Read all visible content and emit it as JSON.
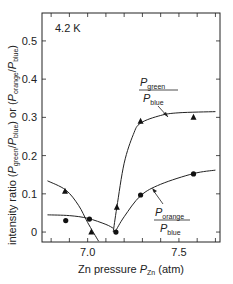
{
  "chart_data": {
    "type": "scatter",
    "title": "",
    "annotation": "4.2 K",
    "xlabel": "Zn pressure P_Zn (atm)",
    "ylabel": "intensity ratio (P_green/P_blue) or (P_orange/P_blue)",
    "xlim": [
      6.75,
      7.725
    ],
    "ylim": [
      -0.026,
      0.573
    ],
    "x_ticks": [
      6.8,
      6.9,
      7.0,
      7.1,
      7.2,
      7.3,
      7.4,
      7.5,
      7.6,
      7.7
    ],
    "x_tick_labels": [
      {
        "value": 7.0,
        "label": "7.0"
      },
      {
        "value": 7.5,
        "label": "7.5"
      }
    ],
    "y_ticks": [
      0,
      0.1,
      0.2,
      0.3,
      0.4,
      0.5
    ],
    "y_tick_labels": [
      "0",
      "0.1",
      "0.2",
      "0.3",
      "0.4",
      "0.5"
    ],
    "grid": false,
    "series": [
      {
        "name": "P_green/P_blue",
        "marker": "triangle",
        "x": [
          6.876,
          7.02,
          7.16,
          7.29,
          7.58
        ],
        "y": [
          0.107,
          0.0,
          0.065,
          0.29,
          0.3
        ]
      },
      {
        "name": "P_orange/P_blue",
        "marker": "circle",
        "x": [
          6.88,
          7.01,
          7.155,
          7.29,
          7.58
        ],
        "y": [
          0.03,
          0.034,
          0.0,
          0.097,
          0.152
        ]
      }
    ],
    "curves": [
      {
        "name": "green-low-branch",
        "points": [
          [
            6.78,
            0.134
          ],
          [
            6.88,
            0.11
          ],
          [
            6.95,
            0.07
          ],
          [
            7.0,
            0.025
          ],
          [
            7.06,
            -0.024
          ]
        ]
      },
      {
        "name": "orange-low-branch",
        "points": [
          [
            6.78,
            0.045
          ],
          [
            6.9,
            0.043
          ],
          [
            7.0,
            0.036
          ],
          [
            7.1,
            0.02
          ],
          [
            7.14,
            0.01
          ]
        ]
      },
      {
        "name": "green-high-branch",
        "points": [
          [
            7.14,
            0.0
          ],
          [
            7.16,
            0.065
          ],
          [
            7.2,
            0.18
          ],
          [
            7.25,
            0.255
          ],
          [
            7.29,
            0.285
          ],
          [
            7.4,
            0.305
          ],
          [
            7.5,
            0.312
          ],
          [
            7.7,
            0.315
          ]
        ]
      },
      {
        "name": "orange-high-branch",
        "points": [
          [
            7.15,
            0.0
          ],
          [
            7.2,
            0.04
          ],
          [
            7.29,
            0.095
          ],
          [
            7.4,
            0.125
          ],
          [
            7.58,
            0.153
          ],
          [
            7.7,
            0.162
          ]
        ]
      }
    ],
    "legend": [
      {
        "series": "P_green/P_blue",
        "numerator": "P",
        "numerator_sub": "green",
        "denominator": "P",
        "denominator_sub": "blue"
      },
      {
        "series": "P_orange/P_blue",
        "numerator": "P",
        "numerator_sub": "orange",
        "denominator": "P",
        "denominator_sub": "blue"
      }
    ]
  },
  "labels": {
    "temperature": "4.2 K",
    "x_axis_prefix": "Zn pressure ",
    "x_axis_var": "P",
    "x_axis_sub": "Zn",
    "x_axis_unit": " (atm)",
    "y_axis_prefix": "intensity ratio (",
    "y_axis_var1": "P",
    "y_axis_sub1": "green",
    "y_axis_slash1": "/",
    "y_axis_var2": "P",
    "y_axis_sub2": "blue",
    "y_axis_mid": ") or (",
    "y_axis_var3": "P",
    "y_axis_sub3": "orange",
    "y_axis_slash2": "/",
    "y_axis_var4": "P",
    "y_axis_sub4": "blue",
    "y_axis_end": ")",
    "green_label_top": "P",
    "green_label_top_sub": "green",
    "green_label_bot": "P",
    "green_label_bot_sub": "blue",
    "orange_label_top": "P",
    "orange_label_top_sub": "orange",
    "orange_label_bot": "P",
    "orange_label_bot_sub": "blue"
  }
}
